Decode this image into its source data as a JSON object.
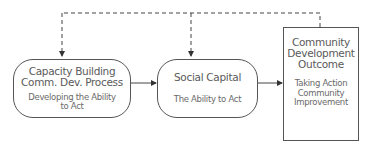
{
  "diagram": {
    "nodes": [
      {
        "id": "capacity-building",
        "title_lines": [
          "Capacity Building",
          "Comm. Dev. Process"
        ],
        "sub_lines": [
          "Developing the Ability",
          "to Act"
        ]
      },
      {
        "id": "social-capital",
        "title_lines": [
          "Social Capital"
        ],
        "sub_lines": [
          "The Ability to Act"
        ]
      },
      {
        "id": "community-development-outcome",
        "title_lines": [
          "Community",
          "Development",
          "Outcome"
        ],
        "sub_lines": [
          "Taking Action",
          "Community",
          "Improvement"
        ]
      }
    ],
    "edges": [
      {
        "from": "capacity-building",
        "to": "social-capital",
        "style": "solid"
      },
      {
        "from": "social-capital",
        "to": "community-development-outcome",
        "style": "solid"
      },
      {
        "from": "community-development-outcome",
        "to": "capacity-building",
        "style": "dashed"
      },
      {
        "from": "community-development-outcome",
        "to": "social-capital",
        "style": "dashed"
      }
    ],
    "colors": {
      "stroke": "#555555",
      "text": "#5a5a5a"
    }
  }
}
